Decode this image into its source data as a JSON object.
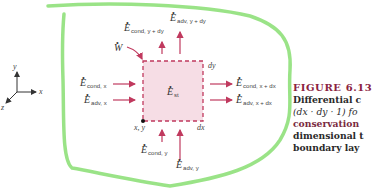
{
  "figure": {
    "number": "FIGURE 6.13",
    "caption_lines": [
      "Differential c",
      "(dx · dy · 1) fo",
      "conservation",
      "dimensional t",
      "boundary lay"
    ]
  },
  "axes": {
    "x": "x",
    "y": "y",
    "z": "z"
  },
  "control_volume": {
    "stored_energy": "E",
    "stored_energy_sub": "st",
    "origin_label": "x, y",
    "width_label": "dx",
    "height_label": "dy",
    "fill_color": "#f6dde5",
    "border_color": "#c0395e"
  },
  "work": {
    "symbol": "W"
  },
  "flows": {
    "cond_x": {
      "symbol": "E",
      "sub": "cond, x"
    },
    "adv_x": {
      "symbol": "E",
      "sub": "adv, x"
    },
    "cond_x_dx": {
      "symbol": "E",
      "sub": "cond, x + dx"
    },
    "adv_x_dx": {
      "symbol": "E",
      "sub": "adv, x + dx"
    },
    "cond_y": {
      "symbol": "E",
      "sub": "cond, y"
    },
    "adv_y": {
      "symbol": "E",
      "sub": "adv, y"
    },
    "cond_y_dy": {
      "symbol": "E",
      "sub": "cond, y + dy"
    },
    "adv_y_dy": {
      "symbol": "E",
      "sub": "adv, y + dy"
    }
  },
  "colors": {
    "arrow": "#c0395e",
    "highlight_outline": "#8fe07a",
    "caption_title": "#8b2340"
  }
}
